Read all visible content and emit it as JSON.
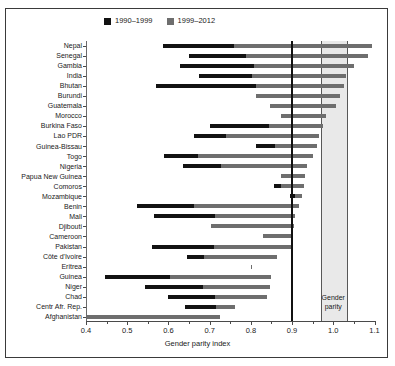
{
  "chart_data": {
    "type": "bar",
    "title": "",
    "subtitle": "",
    "xlabel": "Gender parity index",
    "ylabel": "",
    "xlim": [
      0.4,
      1.1
    ],
    "xticks": [
      0.4,
      0.5,
      0.6,
      0.7,
      0.8,
      0.9,
      1.0,
      1.1
    ],
    "xticklabels": [
      "0.4",
      "0.5",
      "0.6",
      "0.7",
      "0.8",
      "0.9",
      "1.0",
      "1.1"
    ],
    "grid": false,
    "legend_position": "top",
    "orientation": "horizontal",
    "series": [
      {
        "name": "1990–1999",
        "color": "#121212"
      },
      {
        "name": "1999–2012",
        "color": "#6e6e6e"
      }
    ],
    "annotations": [
      {
        "name": "gender-parity-band",
        "label": "Gender parity",
        "label_lines": [
          "Gender",
          "parity"
        ],
        "x_start": 0.97,
        "x_end": 1.03,
        "fill": "#e9e9e9"
      },
      {
        "name": "reference-line",
        "label": "",
        "x": 0.9,
        "color": "#111111"
      }
    ],
    "categories": [
      "Nepal",
      "Senegal",
      "Gambia",
      "India",
      "Bhutan",
      "Burundi",
      "Guatemala",
      "Morocco",
      "Burkina Faso",
      "Lao PDR",
      "Guinea-Bissau",
      "Togo",
      "Nigeria",
      "Papua New Guinea",
      "Comoros",
      "Mozambique",
      "Benin",
      "Mali",
      "Djibouti",
      "Cameroon",
      "Pakistan",
      "Côte d'Ivoire",
      "Eritrea",
      "Guinea",
      "Niger",
      "Chad",
      "Centr Afr. Rep.",
      "Afghanistan"
    ],
    "rows": [
      {
        "country": "Nepal",
        "start": 0.587,
        "mid": 0.759,
        "end": 1.095
      },
      {
        "country": "Senegal",
        "start": 0.651,
        "mid": 0.789,
        "end": 1.085
      },
      {
        "country": "Gambia",
        "start": 0.627,
        "mid": 0.808,
        "end": 1.051
      },
      {
        "country": "India",
        "start": 0.674,
        "mid": 0.803,
        "end": 1.031
      },
      {
        "country": "Bhutan",
        "start": 0.571,
        "mid": 0.813,
        "end": 1.027
      },
      {
        "country": "Burundi",
        "start": 0.813,
        "mid": 0.813,
        "end": 1.017
      },
      {
        "country": "Guatemala",
        "start": 0.846,
        "mid": 0.846,
        "end": 1.007
      },
      {
        "country": "Morocco",
        "start": 0.873,
        "mid": 0.873,
        "end": 0.983
      },
      {
        "country": "Burkina Faso",
        "start": 0.7,
        "mid": 0.844,
        "end": 0.975
      },
      {
        "country": "Lao PDR",
        "start": 0.661,
        "mid": 0.739,
        "end": 0.966
      },
      {
        "country": "Guinea-Bissau",
        "start": 0.813,
        "mid": 0.859,
        "end": 0.96
      },
      {
        "country": "Togo",
        "start": 0.589,
        "mid": 0.672,
        "end": 0.951
      },
      {
        "country": "Nigeria",
        "start": 0.635,
        "mid": 0.727,
        "end": 0.936
      },
      {
        "country": "Papua New Guinea",
        "start": 0.874,
        "mid": 0.874,
        "end": 0.932
      },
      {
        "country": "Comoros",
        "start": 0.857,
        "mid": 0.872,
        "end": 0.93
      },
      {
        "country": "Mozambique",
        "start": 0.895,
        "mid": 0.907,
        "end": 0.925
      },
      {
        "country": "Benin",
        "start": 0.523,
        "mid": 0.662,
        "end": 0.918
      },
      {
        "country": "Mali",
        "start": 0.564,
        "mid": 0.713,
        "end": 0.906
      },
      {
        "country": "Djibouti",
        "start": 0.703,
        "mid": 0.703,
        "end": 0.905
      },
      {
        "country": "Cameroon",
        "start": 0.829,
        "mid": 0.829,
        "end": 0.902
      },
      {
        "country": "Pakistan",
        "start": 0.559,
        "mid": 0.71,
        "end": 0.898
      },
      {
        "country": "Côte d'Ivoire",
        "start": 0.645,
        "mid": 0.687,
        "end": 0.864
      },
      {
        "country": "Eritrea",
        "start": 0.8,
        "mid": 0.8,
        "end": 0.801
      },
      {
        "country": "Guinea",
        "start": 0.447,
        "mid": 0.605,
        "end": 0.849
      },
      {
        "country": "Niger",
        "start": 0.543,
        "mid": 0.684,
        "end": 0.846
      },
      {
        "country": "Chad",
        "start": 0.598,
        "mid": 0.714,
        "end": 0.84
      },
      {
        "country": "Centr Afr. Rep.",
        "start": 0.64,
        "mid": 0.715,
        "end": 0.762
      },
      {
        "country": "Afghanistan",
        "start": 0.4,
        "mid": 0.4,
        "end": 0.725
      }
    ]
  }
}
